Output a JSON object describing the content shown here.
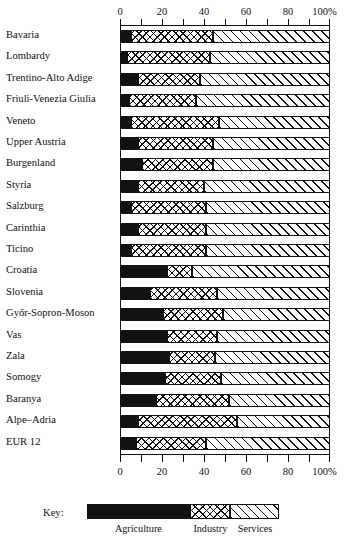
{
  "chart_data": {
    "type": "bar",
    "orientation": "horizontal",
    "stacked": true,
    "title": "",
    "xlabel": "",
    "ylabel": "",
    "xlim": [
      0,
      100
    ],
    "xunit": "%",
    "grid": false,
    "legend_position": "bottom",
    "axis_ticks_major": [
      "0",
      "20",
      "40",
      "60",
      "80",
      "100%"
    ],
    "axis_tick_values": [
      0,
      20,
      40,
      60,
      80,
      100
    ],
    "axis_minor_step": 10,
    "legend_title": "Key:",
    "series": [
      {
        "name": "Agriculture",
        "pattern": "solid-black",
        "color": "#111111",
        "values": [
          5,
          3,
          8,
          4,
          5,
          8,
          10,
          8,
          5,
          8,
          5,
          22,
          14,
          20,
          22,
          23,
          21,
          17,
          8,
          7
        ]
      },
      {
        "name": "Industry",
        "pattern": "cross-hatch",
        "color": "#ffffff",
        "values": [
          39,
          40,
          30,
          32,
          42,
          36,
          34,
          32,
          36,
          33,
          36,
          12,
          32,
          29,
          24,
          22,
          27,
          35,
          48,
          34
        ]
      },
      {
        "name": "Services",
        "pattern": "diagonal-hatch",
        "color": "#ffffff",
        "values": [
          56,
          57,
          62,
          64,
          53,
          56,
          56,
          60,
          59,
          59,
          59,
          66,
          54,
          51,
          54,
          55,
          52,
          48,
          44,
          59
        ]
      }
    ],
    "categories": [
      "Bavaria",
      "Lombardy",
      "Trentino-Alto Adige",
      "Friuli-Venezia Giulia",
      "Veneto",
      "Upper Austria",
      "Burgenland",
      "Styria",
      "Salzburg",
      "Carinthia",
      "Ticino",
      "Croatia",
      "Slovenia",
      "Győr-Sopron-Moson",
      "Vas",
      "Zala",
      "Somogy",
      "Baranya",
      "Alpe–Adria",
      "EUR 12"
    ]
  }
}
